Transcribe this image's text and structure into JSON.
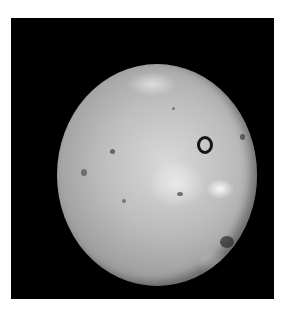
{
  "image": {
    "subject": "moon-io",
    "description": "Grayscale photograph of a mottled, cratered moon against a black background",
    "background_color": "#000000",
    "page_color": "#ffffff"
  }
}
